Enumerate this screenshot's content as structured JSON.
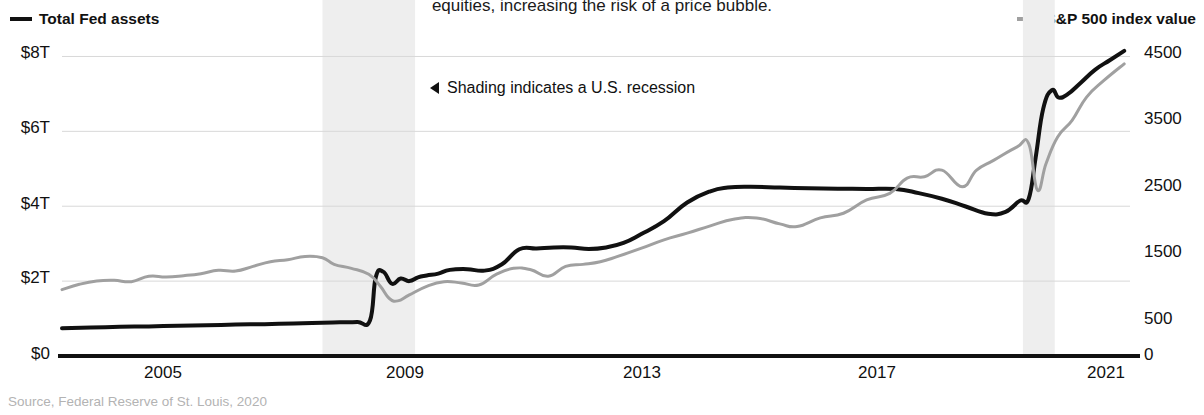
{
  "headline": "equities, increasing the risk of a price bubble.",
  "legend": {
    "left": {
      "label": "Total Fed assets",
      "color": "#111111"
    },
    "right": {
      "label": "S&P 500 index value",
      "color": "#a0a0a0"
    }
  },
  "annotation": {
    "text": "Shading indicates a U.S. recession",
    "marker": "left-triangle-icon"
  },
  "source": "Source, Federal Reserve of St. Louis, 2020",
  "axes": {
    "left_ticks": [
      "$8T",
      "$6T",
      "$4T",
      "$2T",
      "$0"
    ],
    "right_ticks": [
      "4500",
      "3500",
      "2500",
      "1500",
      "500",
      "0"
    ],
    "x_ticks": [
      "2005",
      "2009",
      "2013",
      "2017",
      "2021"
    ]
  },
  "chart_data": {
    "type": "line",
    "title": "",
    "xlabel": "",
    "ylabel": "Total Fed assets",
    "y2label": "S&P 500 index value",
    "grid": true,
    "legend_position": "top-left and top-right",
    "xlim": [
      2003.4,
      2021.85
    ],
    "ylim": [
      0,
      8.6
    ],
    "y2lim": [
      0,
      4850
    ],
    "ytick_values": [
      0,
      2,
      4,
      6,
      8
    ],
    "ytick_labels": [
      "$0",
      "$2T",
      "$4T",
      "$6T",
      "$8T"
    ],
    "y2tick_values": [
      0,
      500,
      1500,
      2500,
      3500,
      4500
    ],
    "y2tick_labels": [
      "0",
      "500",
      "1500",
      "2500",
      "3500",
      "4500"
    ],
    "xtick_values": [
      2005,
      2009,
      2013,
      2017,
      2021
    ],
    "xtick_labels": [
      "2005",
      "2009",
      "2013",
      "2017",
      "2021"
    ],
    "shaded_regions": [
      {
        "label": "U.S. recession",
        "x_start": 2007.9,
        "x_end": 2009.5,
        "color": "#eeeeee"
      },
      {
        "label": "U.S. recession",
        "x_start": 2020.0,
        "x_end": 2020.55,
        "color": "#eeeeee"
      }
    ],
    "series": [
      {
        "name": "Total Fed assets",
        "axis": "left",
        "units": "trillions USD",
        "color": "#111111",
        "x": [
          2003.4,
          2003.9,
          2004.4,
          2004.9,
          2005.4,
          2005.9,
          2006.4,
          2006.9,
          2007.4,
          2007.9,
          2008.2,
          2008.5,
          2008.72,
          2008.82,
          2008.95,
          2009.1,
          2009.25,
          2009.4,
          2009.55,
          2009.7,
          2009.9,
          2010.1,
          2010.4,
          2010.7,
          2011.0,
          2011.3,
          2011.6,
          2011.9,
          2012.2,
          2012.5,
          2012.8,
          2013.1,
          2013.4,
          2013.8,
          2014.2,
          2014.6,
          2014.9,
          2015.3,
          2015.8,
          2016.3,
          2016.8,
          2017.3,
          2017.8,
          2018.2,
          2018.6,
          2019.0,
          2019.4,
          2019.7,
          2019.95,
          2020.1,
          2020.22,
          2020.35,
          2020.5,
          2020.62,
          2020.78,
          2021.0,
          2021.25,
          2021.5,
          2021.75
        ],
        "values": [
          0.74,
          0.76,
          0.78,
          0.79,
          0.81,
          0.82,
          0.84,
          0.85,
          0.87,
          0.89,
          0.9,
          0.91,
          0.95,
          2.1,
          2.25,
          1.93,
          2.07,
          2.0,
          2.1,
          2.15,
          2.2,
          2.3,
          2.32,
          2.28,
          2.45,
          2.85,
          2.87,
          2.9,
          2.9,
          2.86,
          2.9,
          3.02,
          3.25,
          3.6,
          4.1,
          4.4,
          4.5,
          4.52,
          4.5,
          4.48,
          4.47,
          4.46,
          4.46,
          4.35,
          4.2,
          4.0,
          3.8,
          3.85,
          4.15,
          4.2,
          5.3,
          6.6,
          7.1,
          6.9,
          7.0,
          7.3,
          7.65,
          7.9,
          8.15
        ]
      },
      {
        "name": "S&P 500 index value",
        "axis": "right",
        "units": "index points",
        "color": "#a0a0a0",
        "x": [
          2003.4,
          2003.7,
          2004.0,
          2004.3,
          2004.6,
          2004.9,
          2005.2,
          2005.5,
          2005.8,
          2006.1,
          2006.4,
          2006.7,
          2007.0,
          2007.3,
          2007.6,
          2007.9,
          2008.1,
          2008.4,
          2008.7,
          2008.9,
          2009.05,
          2009.2,
          2009.4,
          2009.7,
          2010.0,
          2010.3,
          2010.6,
          2010.9,
          2011.2,
          2011.5,
          2011.8,
          2012.1,
          2012.4,
          2012.7,
          2013.0,
          2013.4,
          2013.8,
          2014.2,
          2014.6,
          2015.0,
          2015.4,
          2015.8,
          2016.1,
          2016.5,
          2016.9,
          2017.3,
          2017.7,
          2018.0,
          2018.3,
          2018.6,
          2018.95,
          2019.2,
          2019.5,
          2019.9,
          2020.1,
          2020.25,
          2020.4,
          2020.6,
          2020.85,
          2021.1,
          2021.4,
          2021.75
        ],
        "values": [
          1000,
          1080,
          1130,
          1140,
          1120,
          1200,
          1190,
          1210,
          1240,
          1290,
          1280,
          1350,
          1420,
          1450,
          1500,
          1480,
          1380,
          1320,
          1230,
          1050,
          870,
          830,
          920,
          1050,
          1120,
          1100,
          1070,
          1230,
          1320,
          1300,
          1200,
          1350,
          1380,
          1420,
          1500,
          1620,
          1750,
          1850,
          1960,
          2060,
          2080,
          1990,
          1950,
          2080,
          2150,
          2350,
          2450,
          2680,
          2700,
          2800,
          2550,
          2800,
          2950,
          3150,
          3200,
          2500,
          2900,
          3300,
          3550,
          3900,
          4150,
          4400
        ]
      }
    ]
  }
}
